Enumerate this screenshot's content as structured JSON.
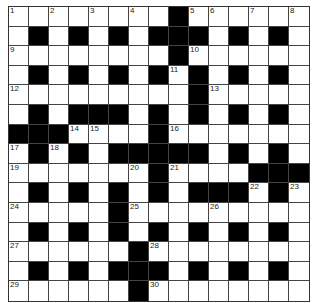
{
  "puzzle": {
    "rows": 15,
    "cols": 15,
    "layout": [
      "........#......",
      ".#.#.#.###.#.#.",
      "........#......",
      ".#.#.#.#.#.#.#.",
      ".........#.....",
      ".#.###.#.#.#.#.",
      "###....#.......",
      ".#.#.#####.#.#.",
      ".......#....###",
      ".#.#.#.#.###.#.",
      ".....#.........",
      ".#.#.#.#.#.#.#.",
      "......#........",
      ".#.#.###.#.#.#.",
      "......#........"
    ],
    "numbers": [
      {
        "n": "1",
        "r": 0,
        "c": 0
      },
      {
        "n": "2",
        "r": 0,
        "c": 2
      },
      {
        "n": "3",
        "r": 0,
        "c": 4
      },
      {
        "n": "4",
        "r": 0,
        "c": 6
      },
      {
        "n": "5",
        "r": 0,
        "c": 9
      },
      {
        "n": "6",
        "r": 0,
        "c": 10
      },
      {
        "n": "7",
        "r": 0,
        "c": 12
      },
      {
        "n": "8",
        "r": 0,
        "c": 14
      },
      {
        "n": "9",
        "r": 2,
        "c": 0
      },
      {
        "n": "10",
        "r": 2,
        "c": 9
      },
      {
        "n": "11",
        "r": 3,
        "c": 8
      },
      {
        "n": "12",
        "r": 4,
        "c": 0
      },
      {
        "n": "13",
        "r": 4,
        "c": 10
      },
      {
        "n": "14",
        "r": 6,
        "c": 3
      },
      {
        "n": "15",
        "r": 6,
        "c": 4
      },
      {
        "n": "16",
        "r": 6,
        "c": 8
      },
      {
        "n": "17",
        "r": 7,
        "c": 0
      },
      {
        "n": "18",
        "r": 7,
        "c": 2
      },
      {
        "n": "19",
        "r": 8,
        "c": 0
      },
      {
        "n": "20",
        "r": 8,
        "c": 6
      },
      {
        "n": "21",
        "r": 8,
        "c": 8
      },
      {
        "n": "22",
        "r": 9,
        "c": 12
      },
      {
        "n": "23",
        "r": 9,
        "c": 14
      },
      {
        "n": "24",
        "r": 10,
        "c": 0
      },
      {
        "n": "25",
        "r": 10,
        "c": 6
      },
      {
        "n": "26",
        "r": 10,
        "c": 10
      },
      {
        "n": "27",
        "r": 12,
        "c": 0
      },
      {
        "n": "28",
        "r": 12,
        "c": 7
      },
      {
        "n": "29",
        "r": 14,
        "c": 0
      },
      {
        "n": "30",
        "r": 14,
        "c": 7
      }
    ],
    "colors": {
      "black_cell": "#000000",
      "white_cell": "#ffffff",
      "grid_line": "#444444"
    }
  }
}
